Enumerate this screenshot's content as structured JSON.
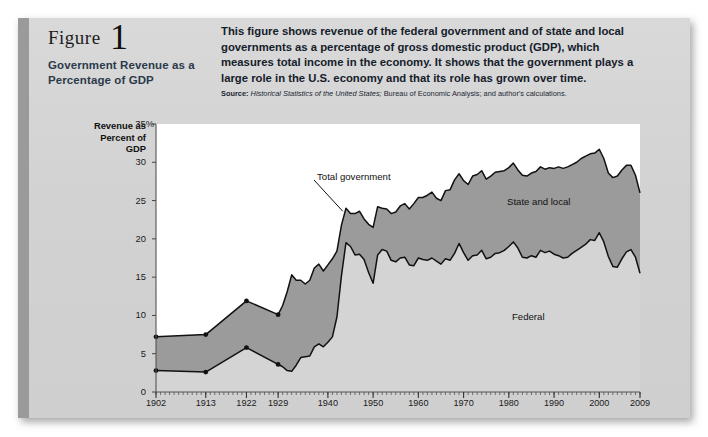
{
  "figure": {
    "label": "Figure",
    "number": "1",
    "title": "Government Revenue as a Percentage of GDP",
    "description": "This figure shows revenue of the federal government and of state and local governments as a percentage of gross domestic product (GDP), which measures total income in the economy. It shows that the government plays a large role in the U.S. economy and that its role has grown over time.",
    "source_label": "Source:",
    "source_italic": "Historical Statistics of the United States;",
    "source_rest": " Bureau of Economic Analysis; and author's calculations."
  },
  "colors": {
    "page_background": "#ffffff",
    "card_background": "#d5d5d5",
    "left_bar": "#9a9a9a",
    "plot_background": "#ffffff",
    "state_local_fill": "#9b9b9b",
    "federal_fill": "#d4d4d4",
    "line": "#111111",
    "text": "#1a1a1a",
    "title_text": "#2b3a4a"
  },
  "chart_data": {
    "type": "area",
    "title": "Government Revenue as a Percentage of GDP",
    "xlabel": "",
    "ylabel": "Revenue as Percent of GDP",
    "ylim": [
      0,
      35
    ],
    "yticks": [
      0,
      5,
      10,
      15,
      20,
      25,
      30,
      35
    ],
    "ytick_labels": [
      "0",
      "5",
      "10",
      "15",
      "20",
      "25",
      "30",
      "35%"
    ],
    "xlim": [
      1902,
      2009
    ],
    "xtick_labels": [
      "1902",
      "1913",
      "1922",
      "1929",
      "1940",
      "1950",
      "1960",
      "1970",
      "1980",
      "1990",
      "2000",
      "2009"
    ],
    "xtick_years": [
      1902,
      1913,
      1922,
      1929,
      1940,
      1950,
      1960,
      1970,
      1980,
      1990,
      2000,
      2009
    ],
    "grid": false,
    "legend_position": "inline-annotations",
    "annotations": [
      {
        "text": "Total government",
        "kind": "callout-with-leader"
      },
      {
        "text": "State and local",
        "kind": "area-label"
      },
      {
        "text": "Federal",
        "kind": "area-label"
      }
    ],
    "series": [
      {
        "name": "Total government",
        "x": [
          1902,
          1913,
          1922,
          1929,
          1930,
          1931,
          1932,
          1933,
          1934,
          1935,
          1936,
          1937,
          1938,
          1939,
          1940,
          1941,
          1942,
          1943,
          1944,
          1945,
          1946,
          1947,
          1948,
          1949,
          1950,
          1951,
          1952,
          1953,
          1954,
          1955,
          1956,
          1957,
          1958,
          1959,
          1960,
          1961,
          1962,
          1963,
          1964,
          1965,
          1966,
          1967,
          1968,
          1969,
          1970,
          1971,
          1972,
          1973,
          1974,
          1975,
          1976,
          1977,
          1978,
          1979,
          1980,
          1981,
          1982,
          1983,
          1984,
          1985,
          1986,
          1987,
          1988,
          1989,
          1990,
          1991,
          1992,
          1993,
          1994,
          1995,
          1996,
          1997,
          1998,
          1999,
          2000,
          2001,
          2002,
          2003,
          2004,
          2005,
          2006,
          2007,
          2008,
          2009
        ],
        "y": [
          7.2,
          7.5,
          11.9,
          10.1,
          11.3,
          13.1,
          15.3,
          14.6,
          14.6,
          14.1,
          14.6,
          16.2,
          16.7,
          15.8,
          16.6,
          17.4,
          18.4,
          21.8,
          24.0,
          23.3,
          23.3,
          23.6,
          22.6,
          21.9,
          21.5,
          24.2,
          24.0,
          23.9,
          23.3,
          23.5,
          24.3,
          24.6,
          23.9,
          24.6,
          25.4,
          25.4,
          25.7,
          26.1,
          25.3,
          25.0,
          26.3,
          26.4,
          27.7,
          28.5,
          27.6,
          27.1,
          28.2,
          28.4,
          28.9,
          27.8,
          28.2,
          28.7,
          28.8,
          28.9,
          29.3,
          29.9,
          29.0,
          28.3,
          28.2,
          28.6,
          28.8,
          29.4,
          29.1,
          29.3,
          29.2,
          29.4,
          29.2,
          29.4,
          29.7,
          30.0,
          30.5,
          30.8,
          31.1,
          31.2,
          31.7,
          30.5,
          28.6,
          28.0,
          28.2,
          29.0,
          29.6,
          29.6,
          28.3,
          26.0
        ]
      },
      {
        "name": "Federal",
        "x": [
          1902,
          1913,
          1922,
          1929,
          1930,
          1931,
          1932,
          1933,
          1934,
          1935,
          1936,
          1937,
          1938,
          1939,
          1940,
          1941,
          1942,
          1943,
          1944,
          1945,
          1946,
          1947,
          1948,
          1949,
          1950,
          1951,
          1952,
          1953,
          1954,
          1955,
          1956,
          1957,
          1958,
          1959,
          1960,
          1961,
          1962,
          1963,
          1964,
          1965,
          1966,
          1967,
          1968,
          1969,
          1970,
          1971,
          1972,
          1973,
          1974,
          1975,
          1976,
          1977,
          1978,
          1979,
          1980,
          1981,
          1982,
          1983,
          1984,
          1985,
          1986,
          1987,
          1988,
          1989,
          1990,
          1991,
          1992,
          1993,
          1994,
          1995,
          1996,
          1997,
          1998,
          1999,
          2000,
          2001,
          2002,
          2003,
          2004,
          2005,
          2006,
          2007,
          2008,
          2009
        ],
        "y": [
          2.8,
          2.6,
          5.8,
          3.6,
          3.3,
          2.8,
          2.7,
          3.5,
          4.5,
          4.6,
          4.7,
          5.9,
          6.3,
          5.9,
          6.5,
          7.2,
          9.8,
          15.2,
          19.5,
          19.0,
          17.9,
          18.0,
          17.3,
          15.6,
          14.2,
          17.9,
          18.6,
          18.4,
          17.2,
          17.0,
          17.5,
          17.6,
          16.6,
          16.5,
          17.5,
          17.3,
          17.2,
          17.5,
          17.1,
          16.7,
          17.4,
          17.2,
          18.1,
          19.4,
          18.2,
          17.2,
          17.8,
          17.9,
          18.5,
          17.4,
          17.6,
          18.1,
          18.2,
          18.5,
          19.0,
          19.6,
          18.8,
          17.6,
          17.5,
          17.8,
          17.6,
          18.5,
          18.2,
          18.4,
          18.0,
          17.8,
          17.5,
          17.6,
          18.1,
          18.5,
          18.9,
          19.3,
          19.9,
          19.8,
          20.8,
          19.6,
          17.7,
          16.4,
          16.3,
          17.4,
          18.3,
          18.6,
          17.6,
          15.5
        ]
      }
    ],
    "markers": {
      "note": "circular data markers shown on early sparse observations",
      "years": [
        1902,
        1913,
        1922,
        1929
      ]
    }
  },
  "axis": {
    "y_title_lines": [
      "Revenue as",
      "Percent of",
      "GDP"
    ]
  }
}
